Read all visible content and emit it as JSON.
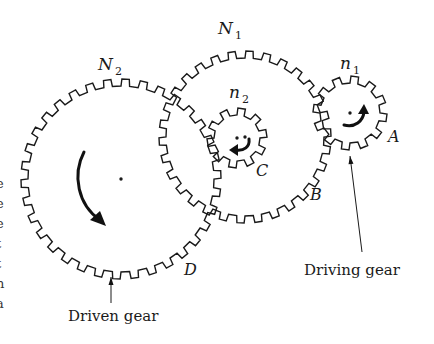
{
  "diagram": {
    "gears": [
      {
        "id": "N2",
        "label": "N",
        "sub": "2",
        "cx": 121,
        "cy": 179,
        "r": 100,
        "teeth": 34,
        "depth": 7,
        "label_x": 98,
        "label_y": 70,
        "point_label": "D",
        "point_x": 184,
        "point_y": 275
      },
      {
        "id": "N1",
        "label": "N",
        "sub": "1",
        "cx": 245,
        "cy": 137,
        "r": 86,
        "teeth": 30,
        "depth": 7,
        "label_x": 218,
        "label_y": 34,
        "point_label": "B",
        "point_x": 310,
        "point_y": 200
      },
      {
        "id": "n2",
        "label": "n",
        "sub": "2",
        "cx": 237,
        "cy": 138,
        "r": 30,
        "teeth": 10,
        "depth": 7,
        "label_x": 229,
        "label_y": 98,
        "point_label": "C",
        "point_x": 256,
        "point_y": 176
      },
      {
        "id": "n1",
        "label": "n",
        "sub": "1",
        "cx": 350,
        "cy": 113,
        "r": 37,
        "teeth": 12,
        "depth": 7,
        "label_x": 340,
        "label_y": 69,
        "point_label": "A",
        "point_x": 388,
        "point_y": 142
      }
    ],
    "callouts": {
      "driving": {
        "text": "Driving gear",
        "x": 304,
        "y": 275,
        "from_x": 362,
        "from_y": 252,
        "to_x": 350,
        "to_y": 156
      },
      "driven": {
        "text": "Driven gear",
        "x": 68,
        "y": 321,
        "from_x": 111,
        "from_y": 303,
        "to_x": 111,
        "to_y": 277
      }
    },
    "rotation_arrows": [
      {
        "gear": "N2",
        "direction": "clockwise"
      },
      {
        "gear": "N1",
        "direction": "none"
      },
      {
        "gear": "n2",
        "direction": "clockwise"
      },
      {
        "gear": "n1",
        "direction": "counterclockwise"
      }
    ],
    "edge_fragments": [
      "e",
      "e",
      "e",
      "t",
      "t",
      "n",
      "a"
    ]
  }
}
